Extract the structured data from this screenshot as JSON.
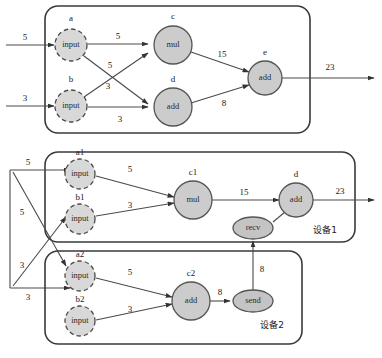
{
  "diagram": {
    "type": "computation-graph-partition"
  },
  "panels": [
    {
      "id": "whole-graph",
      "device_label": "",
      "nodes": [
        {
          "id": "a",
          "name": "a",
          "op": "input",
          "shape": "dashed-circle"
        },
        {
          "id": "b",
          "name": "b",
          "op": "input",
          "shape": "dashed-circle"
        },
        {
          "id": "c",
          "name": "c",
          "op": "mul",
          "shape": "circle"
        },
        {
          "id": "d",
          "name": "d",
          "op": "add",
          "shape": "circle"
        },
        {
          "id": "e",
          "name": "e",
          "op": "add",
          "shape": "circle"
        }
      ],
      "edges": [
        {
          "from": "ext",
          "to": "a",
          "label": "5"
        },
        {
          "from": "ext",
          "to": "b",
          "label": "3"
        },
        {
          "from": "a",
          "to": "c",
          "label": "5"
        },
        {
          "from": "a",
          "to": "d",
          "label": "5"
        },
        {
          "from": "b",
          "to": "c",
          "label": "3"
        },
        {
          "from": "b",
          "to": "d",
          "label": "3"
        },
        {
          "from": "c",
          "to": "e",
          "label": "15"
        },
        {
          "from": "d",
          "to": "e",
          "label": "8"
        },
        {
          "from": "e",
          "to": "ext",
          "label": "23"
        }
      ]
    },
    {
      "id": "device-1",
      "device_label": "设备1",
      "nodes": [
        {
          "id": "a1",
          "name": "a1",
          "op": "input",
          "shape": "dashed-circle"
        },
        {
          "id": "b1",
          "name": "b1",
          "op": "input",
          "shape": "dashed-circle"
        },
        {
          "id": "c1",
          "name": "c1",
          "op": "mul",
          "shape": "circle"
        },
        {
          "id": "d1",
          "name": "d",
          "op": "add",
          "shape": "circle"
        },
        {
          "id": "recv",
          "name": "",
          "op": "recv",
          "shape": "ellipse"
        }
      ],
      "edges": [
        {
          "from": "ext",
          "to": "a1",
          "label": "5"
        },
        {
          "from": "a1",
          "to": "c1",
          "label": "5"
        },
        {
          "from": "b1",
          "to": "c1",
          "label": "3"
        },
        {
          "from": "c1",
          "to": "d1",
          "label": "15"
        },
        {
          "from": "recv",
          "to": "d1",
          "label": ""
        },
        {
          "from": "d1",
          "to": "ext",
          "label": "23"
        }
      ]
    },
    {
      "id": "device-2",
      "device_label": "设备2",
      "nodes": [
        {
          "id": "a2",
          "name": "a2",
          "op": "input",
          "shape": "dashed-circle"
        },
        {
          "id": "b2",
          "name": "b2",
          "op": "input",
          "shape": "dashed-circle"
        },
        {
          "id": "c2",
          "name": "c2",
          "op": "add",
          "shape": "circle"
        },
        {
          "id": "send",
          "name": "",
          "op": "send",
          "shape": "ellipse"
        }
      ],
      "edges": [
        {
          "from": "ext",
          "to": "b2",
          "label": "3"
        },
        {
          "from": "a2",
          "to": "c2",
          "label": "5"
        },
        {
          "from": "b2",
          "to": "c2",
          "label": "3"
        },
        {
          "from": "c2",
          "to": "send",
          "label": "8"
        }
      ]
    }
  ],
  "cross_device_edges": [
    {
      "from": "send",
      "to": "recv",
      "label": "8"
    },
    {
      "from": "ext-fanout-5",
      "to": "a2",
      "label": "5"
    },
    {
      "from": "ext-fanout-3",
      "to": "b1",
      "label": "3"
    }
  ],
  "labels": {
    "op_input": "input",
    "op_mul": "mul",
    "op_add": "add",
    "op_recv": "recv",
    "op_send": "send",
    "node_a": "a",
    "node_b": "b",
    "node_c": "c",
    "node_d": "d",
    "node_e": "e",
    "node_a1": "a1",
    "node_b1": "b1",
    "node_c1": "c1",
    "node_d1": "d",
    "node_a2": "a2",
    "node_b2": "b2",
    "node_c2": "c2",
    "device1": "设备1",
    "device2": "设备2",
    "w_5": "5",
    "w_3": "3",
    "w_8": "8",
    "w_15": "15",
    "w_23": "23"
  },
  "colors": {
    "node_fill": "#cccccc",
    "input_fill": "#d8d8d8",
    "stroke": "#4a4a4a",
    "panel_stroke": "#3a3a3a",
    "background": "#ffffff"
  }
}
